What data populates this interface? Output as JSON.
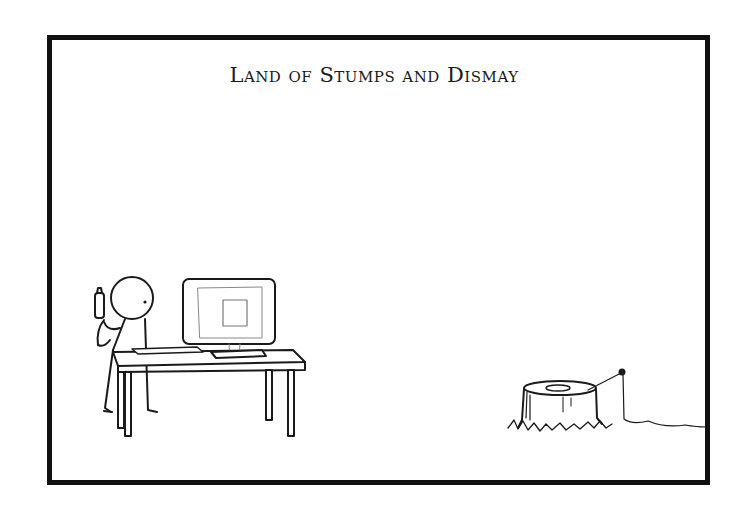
{
  "comic": {
    "title": "Land of Stumps and Dismay",
    "frame_color": "#111111",
    "background": "#ffffff"
  },
  "scene": {
    "left_group": {
      "figure": "stick-figure-at-desk",
      "props": [
        "desk",
        "computer-monitor",
        "keyboard",
        "bottle"
      ]
    },
    "right_group": {
      "object": "tree-stump",
      "props": [
        "string-line",
        "grass"
      ]
    }
  }
}
